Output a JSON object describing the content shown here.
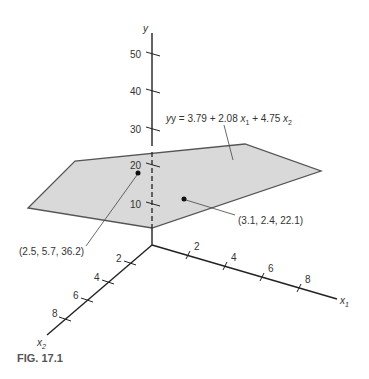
{
  "figure": {
    "caption": "FIG. 17.1",
    "equation": {
      "prefix": "y = 3.79 + 2.08 ",
      "x1": "x",
      "x1_sub": "1",
      "mid": " + 4.75 ",
      "x2": "x",
      "x2_sub": "2"
    },
    "axes": {
      "y_label": "y",
      "x1_label": "x",
      "x1_sub": "1",
      "x2_label": "x",
      "x2_sub": "2",
      "y_ticks": [
        "10",
        "20",
        "30",
        "40",
        "50"
      ],
      "x1_ticks": [
        "2",
        "4",
        "6",
        "8"
      ],
      "x2_ticks": [
        "2",
        "4",
        "6",
        "8"
      ]
    },
    "points": [
      {
        "label": "(2.5, 5.7, 36.2)"
      },
      {
        "label": "(3.1, 2.4, 22.1)"
      }
    ],
    "colors": {
      "plane_fill": "#d9d9d9",
      "plane_edge": "#555555",
      "axis": "#222222"
    }
  }
}
